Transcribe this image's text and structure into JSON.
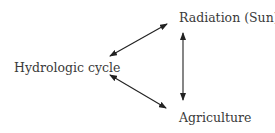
{
  "diagram": {
    "type": "cycle",
    "nodes": [
      {
        "id": "hydrologic_cycle",
        "label": "Hydrologic cycle"
      },
      {
        "id": "radiation",
        "label": "Radiation (Sun)"
      },
      {
        "id": "agriculture",
        "label": "Agriculture"
      }
    ],
    "edges": [
      {
        "from": "hydrologic_cycle",
        "to": "radiation",
        "direction": "bidirectional"
      },
      {
        "from": "radiation",
        "to": "agriculture",
        "direction": "bidirectional"
      },
      {
        "from": "hydrologic_cycle",
        "to": "agriculture",
        "direction": "bidirectional"
      }
    ],
    "colors": {
      "text": "#3a3a3a",
      "arrow": "#222222",
      "background": "#ffffff"
    }
  }
}
